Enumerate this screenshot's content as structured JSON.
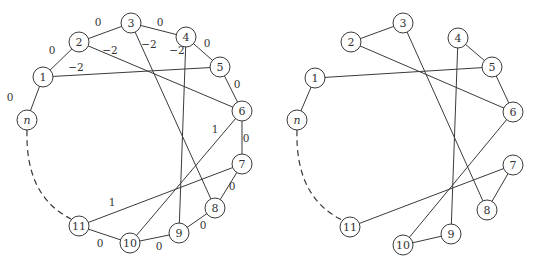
{
  "diagrams": [
    {
      "id": "left",
      "nodes": [
        {
          "id": "1",
          "label": "1",
          "x": 43,
          "y": 77
        },
        {
          "id": "2",
          "label": "2",
          "x": 79,
          "y": 42
        },
        {
          "id": "3",
          "label": "3",
          "x": 131,
          "y": 23
        },
        {
          "id": "4",
          "label": "4",
          "x": 186,
          "y": 37
        },
        {
          "id": "5",
          "label": "5",
          "x": 220,
          "y": 67
        },
        {
          "id": "6",
          "label": "6",
          "x": 242,
          "y": 111
        },
        {
          "id": "7",
          "label": "7",
          "x": 242,
          "y": 164
        },
        {
          "id": "8",
          "label": "8",
          "x": 215,
          "y": 208
        },
        {
          "id": "9",
          "label": "9",
          "x": 179,
          "y": 233
        },
        {
          "id": "10",
          "label": "10",
          "x": 130,
          "y": 243
        },
        {
          "id": "11",
          "label": "11",
          "x": 79,
          "y": 226
        },
        {
          "id": "n",
          "label": "n",
          "x": 27,
          "y": 120,
          "italic": true
        }
      ],
      "edges": [
        {
          "from": "n",
          "to": "1",
          "weight": "0",
          "lx": 10,
          "ly": 97
        },
        {
          "from": "1",
          "to": "2",
          "weight": "0",
          "lx": 52,
          "ly": 50
        },
        {
          "from": "2",
          "to": "3",
          "weight": "0",
          "lx": 98,
          "ly": 22
        },
        {
          "from": "3",
          "to": "4",
          "weight": "0",
          "lx": 160,
          "ly": 22
        },
        {
          "from": "4",
          "to": "5",
          "weight": "0",
          "lx": 207,
          "ly": 43
        },
        {
          "from": "5",
          "to": "6",
          "weight": "0",
          "lx": 237,
          "ly": 84
        },
        {
          "from": "6",
          "to": "7",
          "weight": "0",
          "lx": 246,
          "ly": 138
        },
        {
          "from": "7",
          "to": "8",
          "weight": "0",
          "lx": 232,
          "ly": 186
        },
        {
          "from": "8",
          "to": "9",
          "weight": "0",
          "lx": 203,
          "ly": 225
        },
        {
          "from": "9",
          "to": "10",
          "weight": "0",
          "lx": 159,
          "ly": 246
        },
        {
          "from": "10",
          "to": "11",
          "weight": "0",
          "lx": 100,
          "ly": 243
        },
        {
          "from": "2",
          "to": "6",
          "weight": "−2",
          "lx": 110,
          "ly": 50
        },
        {
          "from": "1",
          "to": "5",
          "weight": "−2",
          "lx": 76,
          "ly": 67
        },
        {
          "from": "3",
          "to": "8",
          "weight": "−2",
          "lx": 149,
          "ly": 44
        },
        {
          "from": "4",
          "to": "9",
          "weight": "−2",
          "lx": 177,
          "ly": 50
        },
        {
          "from": "6",
          "to": "10",
          "weight": "1",
          "lx": 215,
          "ly": 129
        },
        {
          "from": "7",
          "to": "11",
          "weight": "1",
          "lx": 112,
          "ly": 202
        }
      ],
      "dashed_arc": {
        "from": "n",
        "to": "11"
      }
    },
    {
      "id": "right",
      "nodes": [
        {
          "id": "1",
          "label": "1",
          "x": 315,
          "y": 78
        },
        {
          "id": "2",
          "label": "2",
          "x": 351,
          "y": 42
        },
        {
          "id": "3",
          "label": "3",
          "x": 403,
          "y": 23
        },
        {
          "id": "4",
          "label": "4",
          "x": 458,
          "y": 38
        },
        {
          "id": "5",
          "label": "5",
          "x": 492,
          "y": 67
        },
        {
          "id": "6",
          "label": "6",
          "x": 513,
          "y": 112
        },
        {
          "id": "7",
          "label": "7",
          "x": 513,
          "y": 165
        },
        {
          "id": "8",
          "label": "8",
          "x": 487,
          "y": 210
        },
        {
          "id": "9",
          "label": "9",
          "x": 451,
          "y": 234
        },
        {
          "id": "10",
          "label": "10",
          "x": 403,
          "y": 245
        },
        {
          "id": "11",
          "label": "11",
          "x": 350,
          "y": 227
        },
        {
          "id": "n",
          "label": "n",
          "x": 297,
          "y": 120,
          "italic": true
        }
      ],
      "edges": [
        {
          "from": "n",
          "to": "1"
        },
        {
          "from": "2",
          "to": "3"
        },
        {
          "from": "4",
          "to": "5"
        },
        {
          "from": "5",
          "to": "6"
        },
        {
          "from": "7",
          "to": "8"
        },
        {
          "from": "9",
          "to": "10"
        },
        {
          "from": "2",
          "to": "6"
        },
        {
          "from": "1",
          "to": "5"
        },
        {
          "from": "3",
          "to": "8"
        },
        {
          "from": "4",
          "to": "9"
        },
        {
          "from": "6",
          "to": "10"
        },
        {
          "from": "7",
          "to": "11"
        }
      ],
      "dashed_arc": {
        "from": "n",
        "to": "11"
      }
    }
  ]
}
